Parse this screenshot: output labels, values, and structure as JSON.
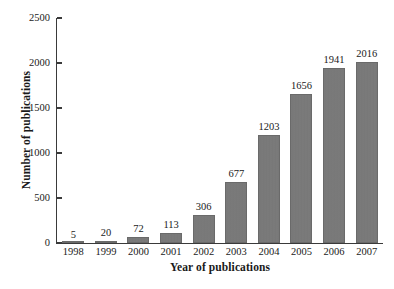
{
  "chart_data": {
    "type": "bar",
    "title": "",
    "xlabel": "Year of publications",
    "ylabel": "Number of publications",
    "categories": [
      "1998",
      "1999",
      "2000",
      "2001",
      "2002",
      "2003",
      "2004",
      "2005",
      "2006",
      "2007"
    ],
    "values": [
      5,
      20,
      72,
      113,
      306,
      677,
      1203,
      1656,
      1941,
      2016
    ],
    "value_labels": [
      "5",
      "20",
      "72",
      "113",
      "306",
      "677",
      "1203",
      "1656",
      "1941",
      "2016"
    ],
    "series": [
      {
        "name": "Number of publications",
        "values": [
          5,
          20,
          72,
          113,
          306,
          677,
          1203,
          1656,
          1941,
          2016
        ]
      }
    ],
    "ylim": [
      0,
      2500
    ],
    "yticks": [
      0,
      500,
      1000,
      1500,
      2000,
      2500
    ],
    "ytick_labels": [
      "0",
      "500",
      "1000",
      "1500",
      "2000",
      "2500"
    ],
    "grid": false,
    "legend": false,
    "legend_position": "none",
    "bar_color": "#787878",
    "axis_color": "#3a3a3a",
    "background_color": "#ffffff",
    "text_color": "#1a1a1a"
  }
}
